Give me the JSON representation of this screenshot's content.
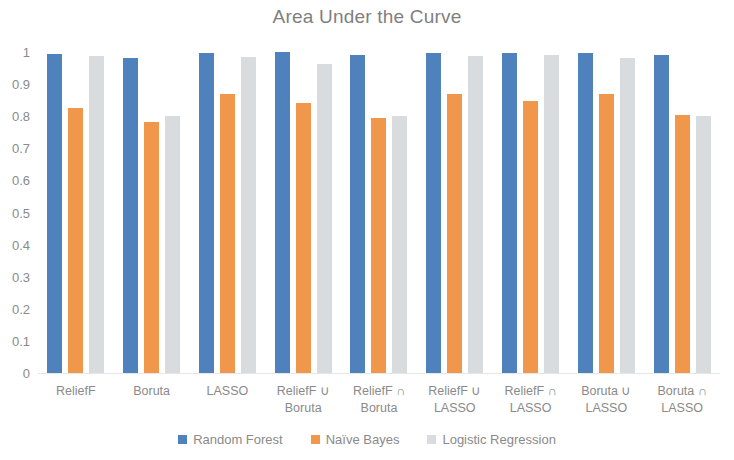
{
  "chart_data": {
    "type": "bar",
    "title": "Area Under the Curve",
    "xlabel": "",
    "ylabel": "",
    "ylim": [
      0,
      1
    ],
    "y_ticks": [
      "1",
      "0.9",
      "0.8",
      "0.7",
      "0.6",
      "0.5",
      "0.4",
      "0.3",
      "0.2",
      "0.1",
      "0"
    ],
    "y_tick_values": [
      1,
      0.9,
      0.8,
      0.7,
      0.6,
      0.5,
      0.4,
      0.3,
      0.2,
      0.1,
      0
    ],
    "grid": false,
    "legend_position": "bottom",
    "categories": [
      "ReliefF",
      "Boruta",
      "LASSO",
      "ReliefF ∪ Boruta",
      "ReliefF ∩ Boruta",
      "ReliefF ∪ LASSO",
      "ReliefF ∩ LASSO",
      "Boruta ∪ LASSO",
      "Boruta ∩ LASSO"
    ],
    "category_lines": [
      [
        "ReliefF"
      ],
      [
        "Boruta"
      ],
      [
        "LASSO"
      ],
      [
        "ReliefF ∪",
        "Boruta"
      ],
      [
        "ReliefF ∩",
        "Boruta"
      ],
      [
        "ReliefF ∪",
        "LASSO"
      ],
      [
        "ReliefF ∩",
        "LASSO"
      ],
      [
        "Boruta ∪",
        "LASSO"
      ],
      [
        "Boruta ∩",
        "LASSO"
      ]
    ],
    "series": [
      {
        "name": "Random Forest",
        "color": "#4f81bd",
        "values": [
          0.995,
          0.982,
          0.998,
          1.0,
          0.99,
          0.998,
          0.998,
          0.998,
          0.992
        ]
      },
      {
        "name": "Naïve Bayes",
        "color": "#f0974c",
        "values": [
          0.825,
          0.782,
          0.868,
          0.84,
          0.793,
          0.868,
          0.848,
          0.87,
          0.805
        ]
      },
      {
        "name": "Logistic Regression",
        "color": "#d8dcdf",
        "values": [
          0.988,
          0.8,
          0.985,
          0.962,
          0.802,
          0.988,
          0.99,
          0.982,
          0.8
        ]
      }
    ]
  },
  "legend": {
    "items": [
      {
        "label": "Random Forest",
        "color": "#4f81bd"
      },
      {
        "label": "Naïve Bayes",
        "color": "#f0974c"
      },
      {
        "label": "Logistic Regression",
        "color": "#d8dcdf"
      }
    ]
  }
}
